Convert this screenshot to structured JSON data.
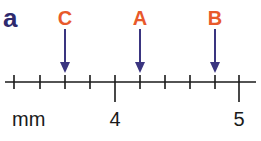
{
  "panel": {
    "label": "a"
  },
  "markers": [
    {
      "label": "C",
      "x": 65
    },
    {
      "label": "A",
      "x": 140
    },
    {
      "label": "B",
      "x": 215
    }
  ],
  "ruler": {
    "unit": "mm",
    "major_ticks": [
      {
        "label": "4",
        "x": 115
      },
      {
        "label": "5",
        "x": 239
      }
    ],
    "minor_tick_x": [
      14,
      40,
      65,
      90,
      140,
      165,
      190,
      215
    ]
  },
  "colors": {
    "panel_label": "#2e2a6e",
    "marker_label": "#e8592b",
    "arrow": "#3a3580",
    "axis": "#1a1a1a"
  }
}
